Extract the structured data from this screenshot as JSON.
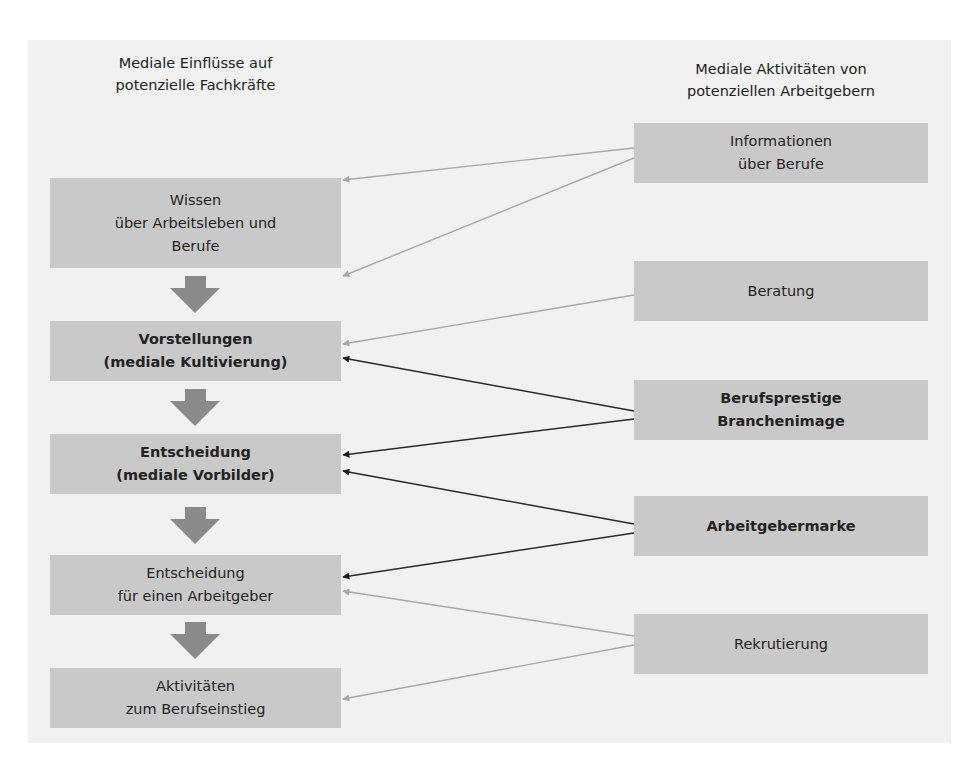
{
  "diagram": {
    "left_column": {
      "title_line1": "Mediale Einflüsse auf",
      "title_line2": "potenzielle Fachkräfte",
      "boxes": [
        {
          "lines": [
            "Wissen",
            "über Arbeitsleben und",
            "Berufe"
          ],
          "bold": false
        },
        {
          "lines": [
            "Vorstellungen",
            "(mediale Kultivierung)"
          ],
          "bold": true
        },
        {
          "lines": [
            "Entscheidung",
            "(mediale Vorbilder)"
          ],
          "bold": true
        },
        {
          "lines": [
            "Entscheidung",
            "für einen Arbeitgeber"
          ],
          "bold": false
        },
        {
          "lines": [
            "Aktivitäten",
            "zum Berufseinstieg"
          ],
          "bold": false
        }
      ]
    },
    "right_column": {
      "title_line1": "Mediale Aktivitäten von",
      "title_line2": "potenziellen Arbeitgebern",
      "boxes": [
        {
          "lines": [
            "Informationen",
            "über Berufe"
          ],
          "bold": false
        },
        {
          "lines": [
            "Beratung"
          ],
          "bold": false
        },
        {
          "lines": [
            "Berufsprestige",
            "Branchenimage"
          ],
          "bold": true
        },
        {
          "lines": [
            "Arbeitgebermarke"
          ],
          "bold": true
        },
        {
          "lines": [
            "Rekrutierung"
          ],
          "bold": false
        }
      ]
    },
    "connections": [
      {
        "from": "Informationen über Berufe",
        "to": "Wissen über Arbeitsleben und Berufe",
        "style": "light"
      },
      {
        "from": "Informationen über Berufe",
        "to": "Vorstellungen (mediale Kultivierung)",
        "style": "light"
      },
      {
        "from": "Beratung",
        "to": "Vorstellungen (mediale Kultivierung)",
        "style": "light"
      },
      {
        "from": "Berufsprestige Branchenimage",
        "to": "Vorstellungen (mediale Kultivierung)",
        "style": "dark"
      },
      {
        "from": "Berufsprestige Branchenimage",
        "to": "Entscheidung (mediale Vorbilder)",
        "style": "dark"
      },
      {
        "from": "Arbeitgebermarke",
        "to": "Entscheidung (mediale Vorbilder)",
        "style": "dark"
      },
      {
        "from": "Arbeitgebermarke",
        "to": "Entscheidung für einen Arbeitgeber",
        "style": "dark"
      },
      {
        "from": "Rekrutierung",
        "to": "Entscheidung für einen Arbeitgeber",
        "style": "light"
      },
      {
        "from": "Rekrutierung",
        "to": "Aktivitäten zum Berufseinstieg",
        "style": "light"
      }
    ],
    "colors": {
      "panel": "#f1f1f1",
      "box": "#c9c9c9",
      "flow_arrow": "#8a8a8a",
      "light_line": "#a8a8a8",
      "dark_line": "#2a2a2a"
    }
  }
}
